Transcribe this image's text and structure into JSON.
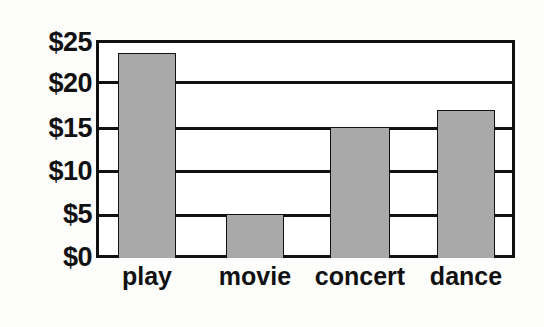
{
  "chart_data": {
    "type": "bar",
    "title": "",
    "subtitle": "",
    "xlabel": "",
    "ylabel": "",
    "categories": [
      "play",
      "movie",
      "concert",
      "dance"
    ],
    "values": [
      23.5,
      5,
      15,
      17
    ],
    "ylim": [
      0,
      25
    ],
    "ytick_values": [
      0,
      5,
      10,
      15,
      20,
      25
    ],
    "ytick_labels": [
      "$0",
      "$5",
      "$10",
      "$15",
      "$20",
      "$25"
    ],
    "grid": true,
    "grid_axis": "y",
    "legend": false,
    "legend_position": "none",
    "bar_color": "#a9a9a9",
    "bar_edge_color": "#111111",
    "axis_color": "#111111",
    "background_color": "#ffffff",
    "bars": [
      {
        "category": "play",
        "value": 23.5
      },
      {
        "category": "movie",
        "value": 5
      },
      {
        "category": "concert",
        "value": 15
      },
      {
        "category": "dance",
        "value": 17
      }
    ]
  }
}
